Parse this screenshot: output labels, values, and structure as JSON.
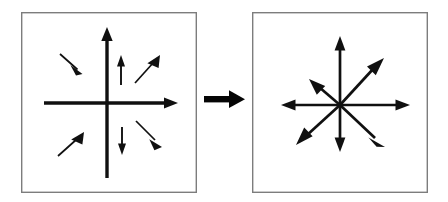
{
  "figure": {
    "caption": "",
    "background_color": "#ffffff",
    "ink_color": "#101010",
    "frame_color": "#7d7d7d",
    "width": 448,
    "height": 202
  },
  "panels": [
    {
      "name": "left-panel",
      "label": "",
      "frame": {
        "x": 21,
        "y": 12,
        "width": 176,
        "height": 181
      },
      "axes": {
        "origin": {
          "x": 107,
          "y": 103
        },
        "horizontal": {
          "x1": 44,
          "y1": 103,
          "x2": 172,
          "y2": 103,
          "thickness": 3.4,
          "arrowhead_at": "right"
        },
        "vertical": {
          "x1": 107,
          "y1": 178,
          "x2": 107,
          "y2": 33,
          "thickness": 3.4,
          "arrowhead_at": "top"
        }
      },
      "vectors": [
        {
          "name": "vector-upper-left-inward",
          "x1": 61,
          "y1": 55,
          "x2": 81,
          "y2": 73,
          "thickness": 1.6,
          "direction": "down-right"
        },
        {
          "name": "vector-upper-mid-up",
          "x1": 121,
          "y1": 84,
          "x2": 121,
          "y2": 57,
          "thickness": 1.6,
          "direction": "up"
        },
        {
          "name": "vector-upper-right-outward",
          "x1": 136,
          "y1": 82,
          "x2": 160,
          "y2": 56,
          "thickness": 1.6,
          "direction": "up-right"
        },
        {
          "name": "vector-lower-left-inward",
          "x1": 60,
          "y1": 155,
          "x2": 83,
          "y2": 134,
          "thickness": 1.6,
          "direction": "up-right"
        },
        {
          "name": "vector-lower-mid-down",
          "x1": 122,
          "y1": 128,
          "x2": 122,
          "y2": 153,
          "thickness": 1.6,
          "direction": "down"
        },
        {
          "name": "vector-lower-right-outward",
          "x1": 137,
          "y1": 122,
          "x2": 161,
          "y2": 146,
          "thickness": 1.6,
          "direction": "down-right"
        }
      ]
    },
    {
      "name": "right-panel",
      "label": "",
      "frame": {
        "x": 252,
        "y": 12,
        "width": 176,
        "height": 181
      },
      "axes": null,
      "vectors": [
        {
          "name": "ray-up",
          "x1": 340,
          "y1": 105,
          "x2": 340,
          "y2": 37,
          "thickness": 2.6,
          "direction": "up"
        },
        {
          "name": "ray-up-right",
          "x1": 340,
          "y1": 105,
          "x2": 382,
          "y2": 60,
          "thickness": 2.6,
          "direction": "up-right"
        },
        {
          "name": "ray-right",
          "x1": 340,
          "y1": 105,
          "x2": 409,
          "y2": 105,
          "thickness": 2.6,
          "direction": "right"
        },
        {
          "name": "ray-down-right",
          "x1": 340,
          "y1": 105,
          "x2": 383,
          "y2": 146,
          "thickness": 2.6,
          "direction": "down-right"
        },
        {
          "name": "ray-down",
          "x1": 340,
          "y1": 105,
          "x2": 340,
          "y2": 151,
          "thickness": 2.6,
          "direction": "down"
        },
        {
          "name": "ray-down-left",
          "x1": 340,
          "y1": 105,
          "x2": 297,
          "y2": 145,
          "thickness": 2.6,
          "direction": "down-left"
        },
        {
          "name": "ray-left",
          "x1": 340,
          "y1": 105,
          "x2": 281,
          "y2": 105,
          "thickness": 2.6,
          "direction": "left"
        },
        {
          "name": "ray-up-left",
          "x1": 340,
          "y1": 105,
          "x2": 311,
          "y2": 80,
          "thickness": 2.6,
          "direction": "up-left"
        }
      ]
    }
  ],
  "transition_arrow": {
    "name": "transition-arrow",
    "label": "",
    "x1": 205,
    "y1": 99,
    "x2": 245,
    "y2": 99,
    "shaft_thickness": 6,
    "head_length": 14,
    "head_half_width": 9,
    "direction": "right"
  }
}
